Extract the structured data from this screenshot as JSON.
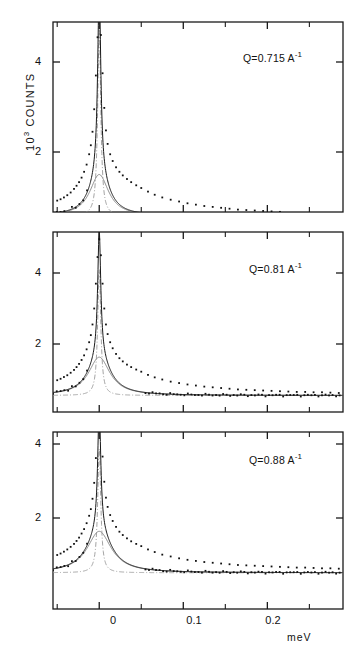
{
  "figure": {
    "ylabel_prefix": "10",
    "ylabel_exponent": "3",
    "ylabel_text": "COUNTS",
    "xunit": "meV"
  },
  "axis": {
    "y_ticks": [
      "4",
      "2"
    ],
    "x_ticks": [
      "0",
      "0.1",
      "0.2"
    ]
  },
  "panels": [
    {
      "id": "panel-1",
      "q_label": "Q=0.715 A",
      "q_exponent": "-1"
    },
    {
      "id": "panel-2",
      "q_label": "Q=0.81 A",
      "q_exponent": "-1"
    },
    {
      "id": "panel-3",
      "q_label": "Q=0.88 A",
      "q_exponent": "-1"
    }
  ],
  "chart_data": {
    "type": "line",
    "title": "",
    "xlabel": "meV",
    "ylabel": "10^3 COUNTS",
    "xlim": [
      -0.055,
      0.29
    ],
    "x_tick_values": [
      0,
      0.1,
      0.2
    ],
    "y_tick_values": [
      2,
      4
    ],
    "grid": false,
    "legend": "none",
    "note": "Quasi-elastic neutron scattering spectra at three momentum transfers Q. Each panel: measured counts (points), total fit (solid), narrow elastic component (dash-dot), broad quasi-elastic Lorentzian (thin solid).",
    "panels": [
      {
        "name": "Q=0.715 A^-1",
        "ylim": [
          0,
          5.4
        ],
        "components": {
          "elastic": {
            "center": 0.0,
            "hwhm": 0.0022,
            "amplitude": 4.15,
            "style": "dash-dot"
          },
          "quasielastic": {
            "center": 0.0,
            "hwhm": 0.0135,
            "amplitude": 0.92,
            "style": "thin-solid"
          },
          "background": 0.58,
          "total_peak": 5.15
        },
        "x": [
          -0.05,
          -0.046,
          -0.042,
          -0.038,
          -0.034,
          -0.03,
          -0.027,
          -0.024,
          -0.021,
          -0.018,
          -0.015,
          -0.012,
          -0.01,
          -0.008,
          -0.006,
          -0.004,
          -0.002,
          0.0,
          0.002,
          0.004,
          0.006,
          0.008,
          0.01,
          0.013,
          0.016,
          0.02,
          0.024,
          0.028,
          0.033,
          0.038,
          0.044,
          0.05,
          0.058,
          0.066,
          0.075,
          0.085,
          0.095,
          0.105,
          0.115,
          0.125,
          0.135,
          0.145,
          0.155,
          0.165,
          0.175,
          0.185,
          0.195,
          0.205,
          0.215,
          0.225,
          0.235,
          0.245,
          0.255,
          0.265,
          0.275,
          0.285
        ],
        "y": [
          0.92,
          0.95,
          0.99,
          1.04,
          1.1,
          1.18,
          1.25,
          1.33,
          1.43,
          1.56,
          1.72,
          1.95,
          2.15,
          2.45,
          2.95,
          3.7,
          4.55,
          5.15,
          4.6,
          3.75,
          2.98,
          2.48,
          2.18,
          1.95,
          1.8,
          1.66,
          1.56,
          1.48,
          1.4,
          1.33,
          1.26,
          1.2,
          1.12,
          1.05,
          0.99,
          0.94,
          0.9,
          0.86,
          0.83,
          0.8,
          0.78,
          0.76,
          0.74,
          0.72,
          0.71,
          0.7,
          0.69,
          0.68,
          0.67,
          0.66,
          0.66,
          0.65,
          0.65,
          0.64,
          0.64,
          0.63
        ]
      },
      {
        "name": "Q=0.81 A^-1",
        "ylim": [
          0,
          5.4
        ],
        "components": {
          "elastic": {
            "center": 0.0,
            "hwhm": 0.0022,
            "amplitude": 3.55,
            "style": "dash-dot"
          },
          "quasielastic": {
            "center": 0.0,
            "hwhm": 0.0155,
            "amplitude": 1.08,
            "style": "thin-solid"
          },
          "background": 0.55,
          "total_peak": 4.95
        },
        "x": [
          -0.05,
          -0.046,
          -0.042,
          -0.038,
          -0.034,
          -0.03,
          -0.027,
          -0.024,
          -0.021,
          -0.018,
          -0.015,
          -0.012,
          -0.01,
          -0.008,
          -0.006,
          -0.004,
          -0.002,
          0.0,
          0.002,
          0.004,
          0.006,
          0.008,
          0.01,
          0.013,
          0.016,
          0.02,
          0.024,
          0.028,
          0.033,
          0.038,
          0.044,
          0.05,
          0.058,
          0.066,
          0.075,
          0.085,
          0.095,
          0.105,
          0.115,
          0.125,
          0.135,
          0.145,
          0.155,
          0.165,
          0.175,
          0.185,
          0.195,
          0.205,
          0.215,
          0.225,
          0.235,
          0.245,
          0.255,
          0.265,
          0.275,
          0.285
        ],
        "y": [
          0.98,
          1.02,
          1.07,
          1.12,
          1.19,
          1.27,
          1.35,
          1.44,
          1.55,
          1.68,
          1.85,
          2.05,
          2.25,
          2.55,
          3.0,
          3.7,
          4.45,
          4.95,
          4.5,
          3.7,
          3.0,
          2.55,
          2.28,
          2.05,
          1.88,
          1.72,
          1.6,
          1.51,
          1.42,
          1.35,
          1.28,
          1.22,
          1.13,
          1.06,
          1.0,
          0.94,
          0.9,
          0.86,
          0.83,
          0.8,
          0.78,
          0.76,
          0.74,
          0.72,
          0.71,
          0.7,
          0.69,
          0.68,
          0.67,
          0.66,
          0.65,
          0.65,
          0.64,
          0.64,
          0.63,
          0.62
        ]
      },
      {
        "name": "Q=0.88 A^-1",
        "ylim": [
          0,
          5.4
        ],
        "components": {
          "elastic": {
            "center": 0.0,
            "hwhm": 0.0022,
            "amplitude": 3.35,
            "style": "dash-dot"
          },
          "quasielastic": {
            "center": 0.0,
            "hwhm": 0.0175,
            "amplitude": 1.12,
            "style": "thin-solid"
          },
          "background": 0.52,
          "total_peak": 4.85
        },
        "x": [
          -0.05,
          -0.046,
          -0.042,
          -0.038,
          -0.034,
          -0.03,
          -0.027,
          -0.024,
          -0.021,
          -0.018,
          -0.015,
          -0.012,
          -0.01,
          -0.008,
          -0.006,
          -0.004,
          -0.002,
          0.0,
          0.002,
          0.004,
          0.006,
          0.008,
          0.01,
          0.013,
          0.016,
          0.02,
          0.024,
          0.028,
          0.033,
          0.038,
          0.044,
          0.05,
          0.058,
          0.066,
          0.075,
          0.085,
          0.095,
          0.105,
          0.115,
          0.125,
          0.135,
          0.145,
          0.155,
          0.165,
          0.175,
          0.185,
          0.195,
          0.205,
          0.215,
          0.225,
          0.235,
          0.245,
          0.255,
          0.265,
          0.275,
          0.285
        ],
        "y": [
          1.0,
          1.04,
          1.09,
          1.15,
          1.22,
          1.3,
          1.38,
          1.47,
          1.58,
          1.7,
          1.86,
          2.06,
          2.24,
          2.52,
          2.95,
          3.62,
          4.35,
          4.85,
          4.42,
          3.66,
          2.98,
          2.55,
          2.3,
          2.08,
          1.92,
          1.76,
          1.63,
          1.54,
          1.45,
          1.37,
          1.3,
          1.24,
          1.15,
          1.08,
          1.01,
          0.96,
          0.91,
          0.87,
          0.84,
          0.81,
          0.79,
          0.77,
          0.75,
          0.73,
          0.72,
          0.71,
          0.7,
          0.69,
          0.68,
          0.67,
          0.66,
          0.66,
          0.65,
          0.64,
          0.64,
          0.63
        ]
      }
    ]
  }
}
